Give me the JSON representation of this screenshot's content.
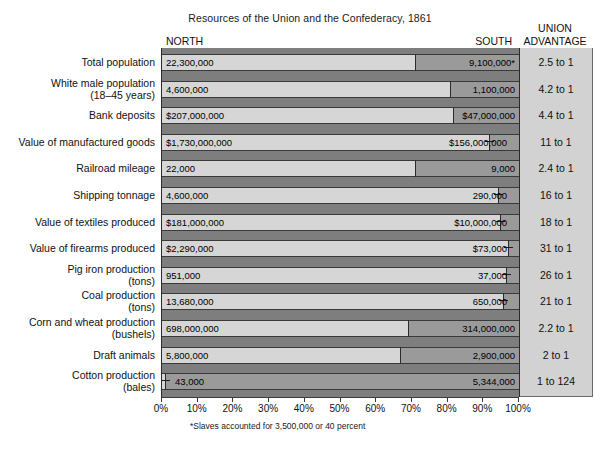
{
  "title": "Resources of the Union and the Confederacy, 1861",
  "headers": {
    "north": "NORTH",
    "south": "SOUTH",
    "union_line1": "UNION",
    "union_line2": "ADVANTAGE"
  },
  "footnote": "*Slaves accounted for 3,500,000 or 40 percent",
  "axis": {
    "ticks": [
      "0%",
      "10%",
      "20%",
      "30%",
      "40%",
      "50%",
      "60%",
      "70%",
      "80%",
      "90%",
      "100%"
    ]
  },
  "colors": {
    "north_bar": "#d6d6d6",
    "south_bar": "#9a9a9a",
    "plot_background": "#7e7e7e",
    "advantage_panel": "#d2d2d2",
    "outline": "#2b2b2b"
  },
  "chart_data": {
    "type": "bar",
    "subtype": "100% stacked horizontal bar",
    "title": "Resources of the Union and the Confederacy, 1861",
    "xlabel": "",
    "ylabel": "",
    "xlim": [
      0,
      100
    ],
    "xticks": [
      0,
      10,
      20,
      30,
      40,
      50,
      60,
      70,
      80,
      90,
      100
    ],
    "grid": false,
    "legend": [
      "NORTH",
      "SOUTH"
    ],
    "legend_position": "column headers",
    "categories": [
      "Total population",
      "White male population (18–45 years)",
      "Bank deposits",
      "Value of manufactured goods",
      "Railroad mileage",
      "Shipping tonnage",
      "Value of textiles produced",
      "Value of firearms produced",
      "Pig iron production (tons)",
      "Coal production (tons)",
      "Corn and wheat production (bushels)",
      "Draft animals",
      "Cotton production (bales)"
    ],
    "series": [
      {
        "name": "NORTH",
        "values": [
          22300000,
          4600000,
          207000000,
          1730000000,
          22000,
          4600000,
          181000000,
          2290000,
          951000,
          13680000,
          698000000,
          5800000,
          43000
        ],
        "percent": [
          71.0,
          80.7,
          81.5,
          91.7,
          71.0,
          94.1,
          94.8,
          96.9,
          96.3,
          95.5,
          69.0,
          66.7,
          0.8
        ]
      },
      {
        "name": "SOUTH",
        "values": [
          9100000,
          1100000,
          47000000,
          156000000,
          9000,
          290000,
          10000000,
          73000,
          37000,
          650000,
          314000000,
          2900000,
          5344000
        ],
        "percent": [
          29.0,
          19.3,
          18.5,
          8.3,
          29.0,
          5.9,
          5.2,
          3.1,
          3.7,
          4.5,
          31.0,
          33.3,
          99.2
        ]
      }
    ],
    "union_advantage": [
      "2.5 to 1",
      "4.2 to 1",
      "4.4 to 1",
      "11 to 1",
      "2.4 to 1",
      "16 to 1",
      "18 to 1",
      "31 to 1",
      "26 to 1",
      "21 to 1",
      "2.2 to 1",
      "2 to 1",
      "1 to 124"
    ]
  },
  "rows": [
    {
      "label_line1": "Total population",
      "label_line2": "",
      "north_value": "22,300,000",
      "south_value": "9,100,000*",
      "advantage": "2.5 to 1",
      "north_pct": 71.0,
      "marker": "none"
    },
    {
      "label_line1": "White male population",
      "label_line2": "(18–45 years)",
      "north_value": "4,600,000",
      "south_value": "1,100,000",
      "advantage": "4.2 to 1",
      "north_pct": 80.7,
      "marker": "none"
    },
    {
      "label_line1": "Bank deposits",
      "label_line2": "",
      "north_value": "$207,000,000",
      "south_value": "$47,000,000",
      "advantage": "4.4 to 1",
      "north_pct": 81.5,
      "marker": "none"
    },
    {
      "label_line1": "Value of manufactured goods",
      "label_line2": "",
      "north_value": "$1,730,000,000",
      "south_value": "$156,000,000",
      "advantage": "11 to 1",
      "north_pct": 91.7,
      "marker": "right"
    },
    {
      "label_line1": "Railroad mileage",
      "label_line2": "",
      "north_value": "22,000",
      "south_value": "9,000",
      "advantage": "2.4 to 1",
      "north_pct": 71.0,
      "marker": "none"
    },
    {
      "label_line1": "Shipping tonnage",
      "label_line2": "",
      "north_value": "4,600,000",
      "south_value": "290,000",
      "advantage": "16 to 1",
      "north_pct": 94.1,
      "marker": "right"
    },
    {
      "label_line1": "Value of textiles produced",
      "label_line2": "",
      "north_value": "$181,000,000",
      "south_value": "$10,000,000",
      "advantage": "18 to 1",
      "north_pct": 94.8,
      "marker": "right"
    },
    {
      "label_line1": "Value of firearms produced",
      "label_line2": "",
      "north_value": "$2,290,000",
      "south_value": "$73,000",
      "advantage": "31 to 1",
      "north_pct": 96.9,
      "marker": "right"
    },
    {
      "label_line1": "Pig iron production",
      "label_line2": "(tons)",
      "north_value": "951,000",
      "south_value": "37,000",
      "advantage": "26 to 1",
      "north_pct": 96.3,
      "marker": "right"
    },
    {
      "label_line1": "Coal production",
      "label_line2": "(tons)",
      "north_value": "13,680,000",
      "south_value": "650,000",
      "advantage": "21 to 1",
      "north_pct": 95.5,
      "marker": "right"
    },
    {
      "label_line1": "Corn and wheat production",
      "label_line2": "(bushels)",
      "north_value": "698,000,000",
      "south_value": "314,000,000",
      "advantage": "2.2 to 1",
      "north_pct": 69.0,
      "marker": "none"
    },
    {
      "label_line1": "Draft animals",
      "label_line2": "",
      "north_value": "5,800,000",
      "south_value": "2,900,000",
      "advantage": "2 to 1",
      "north_pct": 66.7,
      "marker": "none"
    },
    {
      "label_line1": "Cotton production",
      "label_line2": "(bales)",
      "north_value": "43,000",
      "south_value": "5,344,000",
      "advantage": "1 to 124",
      "north_pct": 0.8,
      "marker": "left"
    }
  ]
}
